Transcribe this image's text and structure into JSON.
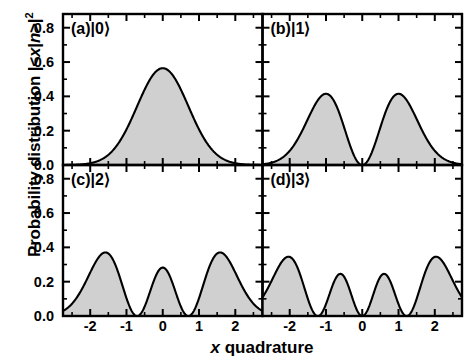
{
  "figure": {
    "ylabel_prefix": "Probability distribution |<",
    "ylabel_x": "x",
    "ylabel_mid": "|",
    "ylabel_n": "n",
    "ylabel_suffix": ">|",
    "ylabel_exp": "2",
    "xlabel_x": "x",
    "xlabel_rest": " quadrature"
  },
  "chart_data": {
    "type": "line",
    "xlabel": "x quadrature",
    "ylabel": "Probability distribution |<x|n>|^2",
    "xlim": [
      -2.75,
      2.75
    ],
    "ylim": [
      0.0,
      0.88
    ],
    "xticks": [
      -2,
      -1,
      0,
      1,
      2
    ],
    "xticklabels": [
      "-2",
      "-1",
      "0",
      "1",
      "2"
    ],
    "yticks": [
      0.0,
      0.2,
      0.4,
      0.6,
      0.8
    ],
    "yticklabels": [
      "0.0",
      "0.2",
      "0.4",
      "0.6",
      "0.8"
    ],
    "grid": false,
    "legend": "none",
    "fill": true,
    "fill_color": "#d0d0d0",
    "line_color": "#000000",
    "panels": [
      {
        "tag": "(a)",
        "ket": "|0⟩",
        "n": 0,
        "row": 0,
        "col": 0,
        "peaks": [
          {
            "x": 0.0,
            "y": 0.797
          }
        ],
        "nodes": []
      },
      {
        "tag": "(b)",
        "ket": "|1⟩",
        "n": 1,
        "row": 0,
        "col": 1,
        "peaks": [
          {
            "x": -0.707,
            "y": 0.586
          },
          {
            "x": 0.707,
            "y": 0.586
          }
        ],
        "nodes": [
          0.0
        ]
      },
      {
        "tag": "(c)",
        "ket": "|2⟩",
        "n": 2,
        "row": 1,
        "col": 0,
        "peaks": [
          {
            "x": -1.13,
            "y": 0.52
          },
          {
            "x": 0.0,
            "y": 0.399
          },
          {
            "x": 1.13,
            "y": 0.52
          }
        ],
        "nodes": [
          -0.707,
          0.707
        ]
      },
      {
        "tag": "(d)",
        "ket": "|3⟩",
        "n": 3,
        "row": 1,
        "col": 1,
        "peaks": [
          {
            "x": -1.45,
            "y": 0.5
          },
          {
            "x": -0.45,
            "y": 0.385
          },
          {
            "x": 0.45,
            "y": 0.385
          },
          {
            "x": 1.45,
            "y": 0.5
          }
        ],
        "nodes": [
          -1.225,
          0.0,
          1.225
        ]
      }
    ]
  }
}
